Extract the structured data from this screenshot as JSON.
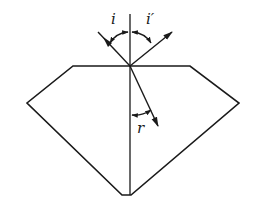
{
  "diagram": {
    "title": "",
    "labels": {
      "incidence_angle": "i",
      "reflection_angle": "i′",
      "refraction_angle": "r"
    },
    "colors": {
      "line": "#1a1a1a",
      "background": "#ffffff"
    }
  }
}
